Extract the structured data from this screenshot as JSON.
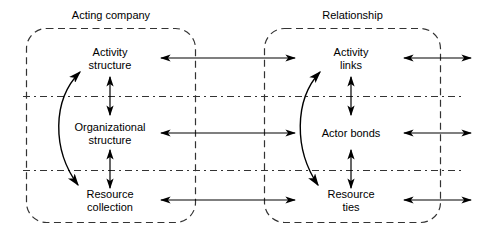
{
  "diagram": {
    "type": "conceptual-framework",
    "panels": [
      {
        "id": "acting-company",
        "title": "Acting company"
      },
      {
        "id": "relationship",
        "title": "Relationship"
      }
    ],
    "rows": [
      {
        "id": "activity",
        "left": "Activity\nstructure",
        "right": "Activity\nlinks"
      },
      {
        "id": "actor",
        "left": "Organizational\nstructure",
        "right": "Actor bonds"
      },
      {
        "id": "resource",
        "left": "Resource\ncollection",
        "right": "Resource\nties"
      }
    ],
    "nodes": {
      "activity_structure_line1": "Activity",
      "activity_structure_line2": "structure",
      "organizational_structure_line1": "Organizational",
      "organizational_structure_line2": "structure",
      "resource_collection_line1": "Resource",
      "resource_collection_line2": "collection",
      "activity_links_line1": "Activity",
      "activity_links_line2": "links",
      "actor_bonds_line1": "Actor bonds",
      "resource_ties_line1": "Resource",
      "resource_ties_line2": "ties"
    },
    "colors": {
      "stroke": "#000000",
      "dashed": "#333333",
      "background": "#ffffff"
    }
  }
}
